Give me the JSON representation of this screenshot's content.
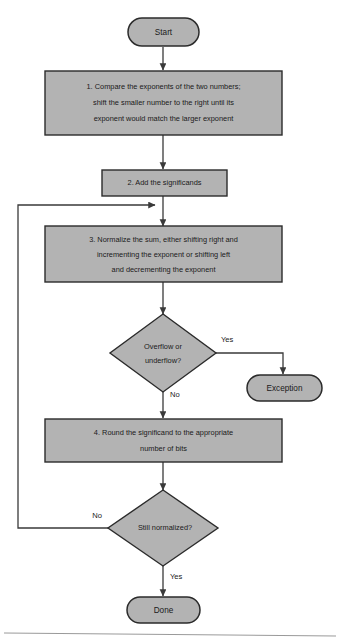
{
  "diagram": {
    "type": "flowchart",
    "colors": {
      "node_fill": "#b3b3b3",
      "node_border": "#2b2b2b",
      "connector": "#3a3a3a",
      "text": "#1a1a1a",
      "background": "#ffffff",
      "rule": "#9a9a9a"
    },
    "nodes": {
      "start": {
        "label": "Start",
        "shape": "terminator"
      },
      "step1": {
        "shape": "process",
        "line1": "1.  Compare the exponents of the two numbers;",
        "line2": "shift the smaller number to the right until its",
        "line3": "exponent would match the larger exponent"
      },
      "step2": {
        "shape": "process",
        "line1": "2. Add the significands"
      },
      "step3": {
        "shape": "process",
        "line1": "3. Normalize the sum, either shifting right and",
        "line2": "incrementing the exponent or shifting left",
        "line3": "and decrementing the exponent"
      },
      "decision1": {
        "shape": "decision",
        "line1": "Overflow or",
        "line2": "underflow?"
      },
      "exception": {
        "label": "Exception",
        "shape": "terminator"
      },
      "step4": {
        "shape": "process",
        "line1": "4. Round the significand to the appropriate",
        "line2": "number of bits"
      },
      "decision2": {
        "shape": "decision",
        "line1": "Still normalized?"
      },
      "done": {
        "label": "Done",
        "shape": "terminator"
      }
    },
    "edge_labels": {
      "overflow_yes": "Yes",
      "overflow_no": "No",
      "normalized_no": "No",
      "normalized_yes": "Yes"
    }
  }
}
